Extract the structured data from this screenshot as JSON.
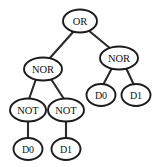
{
  "diagram": {
    "type": "binary-expression-tree",
    "colors": {
      "background": "#ffffff",
      "node_fill": "#ffffff",
      "node_stroke": "#1c1c1c",
      "edge_stroke": "#2b2b2b",
      "label_color": "#111111"
    },
    "nodes": [
      {
        "id": "n0",
        "label": "OR",
        "cx": 80,
        "cy": 21,
        "rx": 17,
        "ry": 11.5,
        "font_size": 10.5
      },
      {
        "id": "n1",
        "label": "NOR",
        "cx": 43,
        "cy": 69,
        "rx": 19,
        "ry": 11.5,
        "font_size": 10.5
      },
      {
        "id": "n2",
        "label": "NOR",
        "cx": 119,
        "cy": 58,
        "rx": 19,
        "ry": 11.5,
        "font_size": 10.5
      },
      {
        "id": "n3",
        "label": "NOT",
        "cx": 28,
        "cy": 110,
        "rx": 18,
        "ry": 11.5,
        "font_size": 10.5
      },
      {
        "id": "n4",
        "label": "NOT",
        "cx": 66,
        "cy": 110,
        "rx": 18,
        "ry": 11.5,
        "font_size": 10.5
      },
      {
        "id": "n5",
        "label": "D0",
        "cx": 101,
        "cy": 95,
        "rx": 14.5,
        "ry": 11,
        "font_size": 10
      },
      {
        "id": "n6",
        "label": "D1",
        "cx": 136,
        "cy": 95,
        "rx": 14.5,
        "ry": 11,
        "font_size": 10
      },
      {
        "id": "n7",
        "label": "D0",
        "cx": 28,
        "cy": 149,
        "rx": 14.5,
        "ry": 11,
        "font_size": 10
      },
      {
        "id": "n8",
        "label": "D1",
        "cx": 66,
        "cy": 149,
        "rx": 14.5,
        "ry": 11,
        "font_size": 10
      }
    ],
    "edges": [
      {
        "id": "e0",
        "from": "n0",
        "to": "n1",
        "x1": 74,
        "y1": 31,
        "x2": 49,
        "y2": 59
      },
      {
        "id": "e1",
        "from": "n0",
        "to": "n2",
        "x1": 88,
        "y1": 30,
        "x2": 111,
        "y2": 49
      },
      {
        "id": "e2",
        "from": "n1",
        "to": "n3",
        "x1": 36,
        "y1": 79,
        "x2": 29,
        "y2": 99
      },
      {
        "id": "e3",
        "from": "n1",
        "to": "n4",
        "x1": 51,
        "y1": 79,
        "x2": 64,
        "y2": 99
      },
      {
        "id": "e4",
        "from": "n2",
        "to": "n5",
        "x1": 112,
        "y1": 68,
        "x2": 103,
        "y2": 85
      },
      {
        "id": "e5",
        "from": "n2",
        "to": "n6",
        "x1": 126,
        "y1": 68,
        "x2": 134,
        "y2": 85
      },
      {
        "id": "e6",
        "from": "n3",
        "to": "n7",
        "x1": 28,
        "y1": 121,
        "x2": 28,
        "y2": 139
      },
      {
        "id": "e7",
        "from": "n4",
        "to": "n8",
        "x1": 66,
        "y1": 121,
        "x2": 66,
        "y2": 139
      }
    ]
  }
}
